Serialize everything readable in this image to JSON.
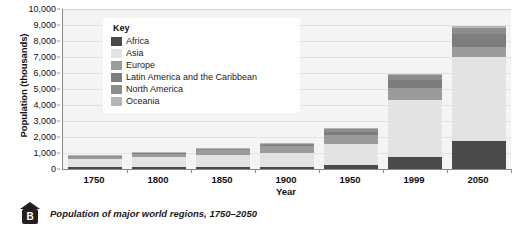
{
  "caption": {
    "badge_letter": "B",
    "text": "Population of major world regions, 1750–2050"
  },
  "legend": {
    "title": "Key"
  },
  "chart_data": {
    "type": "bar",
    "stacked": true,
    "title": "",
    "xlabel": "Year",
    "ylabel": "Population (thousands)",
    "categories": [
      "1750",
      "1800",
      "1850",
      "1900",
      "1950",
      "1999",
      "2050"
    ],
    "ylim": [
      0,
      10000
    ],
    "ytick_labels": [
      "0",
      "1,000",
      "2,000",
      "3,000",
      "4,000",
      "5,000",
      "6,000",
      "7,000",
      "8,000",
      "9,000",
      "10,000"
    ],
    "ytick_values": [
      0,
      1000,
      2000,
      3000,
      4000,
      5000,
      6000,
      7000,
      8000,
      9000,
      10000
    ],
    "grid": true,
    "legend_position": "inside-top-left",
    "series": [
      {
        "name": "Africa",
        "color": "#4a4a4a",
        "values": [
          100,
          110,
          110,
          130,
          230,
          770,
          1750
        ]
      },
      {
        "name": "Asia",
        "color": "#e3e3e3",
        "values": [
          500,
          650,
          790,
          880,
          1350,
          3560,
          5250
        ]
      },
      {
        "name": "Europe",
        "color": "#9b9b9b",
        "values": [
          160,
          200,
          270,
          400,
          550,
          730,
          640
        ]
      },
      {
        "name": "Latin America and the Caribbean",
        "color": "#7d7d7d",
        "values": [
          20,
          20,
          40,
          70,
          170,
          520,
          800
        ]
      },
      {
        "name": "North America",
        "color": "#8d8d8d",
        "values": [
          5,
          10,
          30,
          90,
          170,
          310,
          400
        ]
      },
      {
        "name": "Oceania",
        "color": "#b5b5b5",
        "values": [
          2,
          2,
          2,
          6,
          13,
          30,
          50
        ]
      }
    ],
    "totals": [
      787,
      992,
      1242,
      1576,
      2483,
      5920,
      8890
    ]
  }
}
